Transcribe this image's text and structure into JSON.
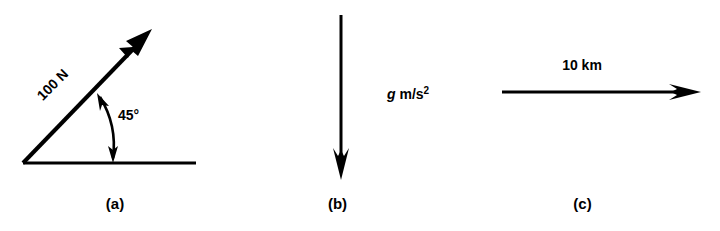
{
  "figure": {
    "background_color": "#ffffff",
    "ink_color": "#000000",
    "panels": [
      {
        "id": "a",
        "caption": "(a)",
        "type": "inclined-force-vector",
        "magnitude_label": "100 N",
        "angle_label": "45°",
        "baseline": {
          "x1": 23,
          "y1": 163,
          "x2": 196,
          "y2": 163
        },
        "vector": {
          "x1": 23,
          "y1": 163,
          "x2": 151,
          "y2": 31,
          "angle_deg": 45
        },
        "angle_arc": {
          "cx": 23,
          "cy": 163,
          "radius": 92,
          "start_deg": 0,
          "end_deg": 45,
          "double_headed": true
        },
        "magnitude_label_pos": {
          "x": 56,
          "y": 88,
          "rotate_deg": -45
        },
        "angle_label_pos": {
          "x": 118,
          "y": 120
        }
      },
      {
        "id": "b",
        "caption": "(b)",
        "type": "vertical-downward-vector",
        "magnitude_label": "g m/s²",
        "magnitude_label_parts": {
          "italic": "g",
          "upright": " m/s",
          "superscript": "2"
        },
        "vector": {
          "x1": 111,
          "y1": 15,
          "x2": 111,
          "y2": 178,
          "direction": "down"
        },
        "magnitude_label_pos": {
          "x": 122,
          "y": 99
        }
      },
      {
        "id": "c",
        "caption": "(c)",
        "type": "horizontal-rightward-vector",
        "magnitude_label": "10 km",
        "vector": {
          "x1": 57,
          "y1": 92,
          "x2": 255,
          "y2": 92,
          "direction": "right"
        },
        "magnitude_label_pos": {
          "x": 137,
          "y": 70
        }
      }
    ]
  }
}
